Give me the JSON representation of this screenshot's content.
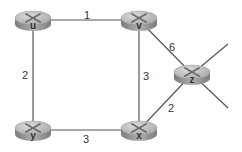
{
  "diagram": {
    "type": "network-graph",
    "colors": {
      "link": "#555555",
      "router_top": "#c4c4c4",
      "router_side": "#8a8a8a",
      "router_x": "#6e6e6e",
      "label": "#333333"
    },
    "nodes": [
      {
        "id": "u",
        "label": "u",
        "x": 33,
        "y": 20
      },
      {
        "id": "v",
        "label": "v",
        "x": 139,
        "y": 20
      },
      {
        "id": "z",
        "label": "z",
        "x": 192,
        "y": 74
      },
      {
        "id": "y",
        "label": "y",
        "x": 33,
        "y": 130
      },
      {
        "id": "x",
        "label": "x",
        "x": 139,
        "y": 130
      }
    ],
    "edges": [
      {
        "from": "u",
        "to": "v",
        "cost": "1",
        "lx": 87,
        "ly": 19
      },
      {
        "from": "u",
        "to": "y",
        "cost": "2",
        "lx": 25,
        "ly": 79
      },
      {
        "from": "v",
        "to": "x",
        "cost": "3",
        "lx": 144,
        "ly": 80
      },
      {
        "from": "v",
        "to": "z",
        "cost": "6",
        "lx": 170,
        "ly": 51
      },
      {
        "from": "x",
        "to": "z",
        "cost": "2",
        "lx": 169,
        "ly": 112
      },
      {
        "from": "y",
        "to": "x",
        "cost": "3",
        "lx": 84,
        "ly": 143
      }
    ],
    "stubs": [
      {
        "from": "z",
        "x2": 228,
        "y2": 44
      },
      {
        "from": "z",
        "x2": 228,
        "y2": 108
      }
    ]
  }
}
